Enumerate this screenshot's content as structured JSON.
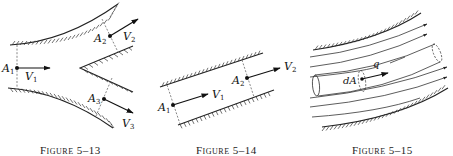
{
  "figures": [
    {
      "id": "5-13",
      "caption": "Figure 5–13",
      "description": "Branching channel: flow enters through section A1 and splits into two outlets A2 and A3",
      "sections": [
        {
          "area": "A",
          "sub": "1",
          "velocity": "V",
          "vsub": "1"
        },
        {
          "area": "A",
          "sub": "2",
          "velocity": "V",
          "vsub": "2"
        },
        {
          "area": "A",
          "sub": "3",
          "velocity": "V",
          "vsub": "3"
        }
      ]
    },
    {
      "id": "5-14",
      "caption": "Figure 5–14",
      "description": "Straight inclined channel with inlet section A1 and outlet section A2",
      "sections": [
        {
          "area": "A",
          "sub": "1",
          "velocity": "V",
          "vsub": "1"
        },
        {
          "area": "A",
          "sub": "2",
          "velocity": "V",
          "vsub": "2"
        }
      ]
    },
    {
      "id": "5-15",
      "caption": "Figure 5–15",
      "description": "Stream tube with elemental area dA within curved streamlines",
      "labels": {
        "area_element": "dA",
        "flow": "q"
      }
    }
  ],
  "colors": {
    "ink": "#111111",
    "background": "#ffffff"
  }
}
